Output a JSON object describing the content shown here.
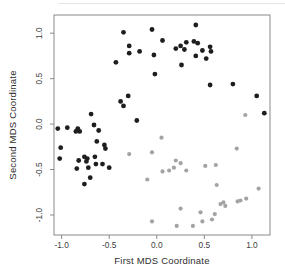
{
  "chart_data": {
    "type": "scatter",
    "title": "",
    "xlabel": "First MDS Coordinate",
    "ylabel": "Second MDS Coordinate",
    "xlim": [
      -1.08,
      1.19
    ],
    "ylim": [
      -1.22,
      1.2
    ],
    "x_ticks": [
      -1.0,
      -0.5,
      0.0,
      0.5,
      1.0
    ],
    "y_ticks": [
      -1.0,
      -0.5,
      0.0,
      0.5,
      1.0
    ],
    "x_tick_labels": [
      "-1.0",
      "-0.5",
      "0.0",
      "0.5",
      "1.0"
    ],
    "y_tick_labels": [
      "-1.0",
      "-0.5",
      "0.0",
      "0.5",
      "1.0"
    ],
    "grid": false,
    "legend": "none",
    "series": [
      {
        "name": "cluster-dark",
        "color": "#1e1e1e",
        "marker": "filled-circle",
        "marker_radius": 2.4,
        "points": [
          [
            -0.35,
            1.01
          ],
          [
            -0.05,
            1.04
          ],
          [
            0.06,
            0.92
          ],
          [
            -0.29,
            0.86
          ],
          [
            -0.29,
            0.78
          ],
          [
            -0.18,
            0.8
          ],
          [
            -0.03,
            0.76
          ],
          [
            -0.43,
            0.68
          ],
          [
            -0.02,
            0.55
          ],
          [
            -0.3,
            0.31
          ],
          [
            -0.38,
            0.25
          ],
          [
            -0.35,
            0.2
          ],
          [
            -0.69,
            0.11
          ],
          [
            -0.21,
            0.04
          ],
          [
            -0.66,
            -0.01
          ],
          [
            0.41,
            1.09
          ],
          [
            0.2,
            0.83
          ],
          [
            0.25,
            0.86
          ],
          [
            0.31,
            0.9
          ],
          [
            0.39,
            0.91
          ],
          [
            0.43,
            0.89
          ],
          [
            0.29,
            0.82
          ],
          [
            0.41,
            0.75
          ],
          [
            0.48,
            0.81
          ],
          [
            0.56,
            0.85
          ],
          [
            0.57,
            0.8
          ],
          [
            0.52,
            0.72
          ],
          [
            0.26,
            0.65
          ],
          [
            0.56,
            0.43
          ],
          [
            0.8,
            0.44
          ],
          [
            1.05,
            0.31
          ],
          [
            1.13,
            0.12
          ],
          [
            -1.04,
            -0.05
          ],
          [
            -0.94,
            -0.04
          ],
          [
            -0.85,
            -0.08
          ],
          [
            -0.83,
            -0.05
          ],
          [
            -0.81,
            -0.08
          ],
          [
            -0.61,
            -0.07
          ],
          [
            -0.63,
            -0.19
          ],
          [
            -0.55,
            -0.23
          ],
          [
            -0.54,
            -0.27
          ],
          [
            -1.01,
            -0.26
          ],
          [
            -1.02,
            -0.38
          ],
          [
            -0.82,
            -0.4
          ],
          [
            -0.76,
            -0.36
          ],
          [
            -0.73,
            -0.38
          ],
          [
            -0.74,
            -0.41
          ],
          [
            -0.65,
            -0.36
          ],
          [
            -0.64,
            -0.44
          ],
          [
            -0.57,
            -0.44
          ],
          [
            -0.84,
            -0.49
          ],
          [
            -0.72,
            -0.48
          ],
          [
            -0.5,
            -0.48
          ],
          [
            -0.7,
            -0.59
          ],
          [
            -0.76,
            -0.66
          ]
        ]
      },
      {
        "name": "cluster-gray",
        "color": "#a3a3a3",
        "marker": "filled-circle",
        "marker_radius": 2.1,
        "points": [
          [
            0.93,
            0.1
          ],
          [
            0.05,
            -0.15
          ],
          [
            -0.29,
            -0.33
          ],
          [
            -0.05,
            -0.31
          ],
          [
            0.2,
            -0.4
          ],
          [
            0.25,
            -0.43
          ],
          [
            0.51,
            -0.46
          ],
          [
            0.62,
            -0.45
          ],
          [
            0.84,
            -0.27
          ],
          [
            0.06,
            -0.52
          ],
          [
            0.13,
            -0.51
          ],
          [
            0.18,
            -0.48
          ],
          [
            0.31,
            -0.51
          ],
          [
            -0.1,
            -0.61
          ],
          [
            0.63,
            -0.67
          ],
          [
            1.07,
            -0.71
          ],
          [
            0.25,
            -0.93
          ],
          [
            0.21,
            -1.12
          ],
          [
            0.38,
            -1.12
          ],
          [
            0.46,
            -0.97
          ],
          [
            0.48,
            -1.07
          ],
          [
            0.58,
            -1.05
          ],
          [
            0.61,
            -0.99
          ],
          [
            0.67,
            -0.88
          ],
          [
            0.7,
            -0.86
          ],
          [
            0.72,
            -0.9
          ],
          [
            0.85,
            -0.85
          ],
          [
            0.88,
            -0.84
          ],
          [
            0.94,
            -0.82
          ],
          [
            -0.05,
            -1.07
          ]
        ]
      }
    ]
  },
  "colors": {
    "background": "#ffffff",
    "axis_line": "#8a8a8a",
    "tick_label": "#3d3d3d",
    "axis_title": "#2e2e2e"
  }
}
